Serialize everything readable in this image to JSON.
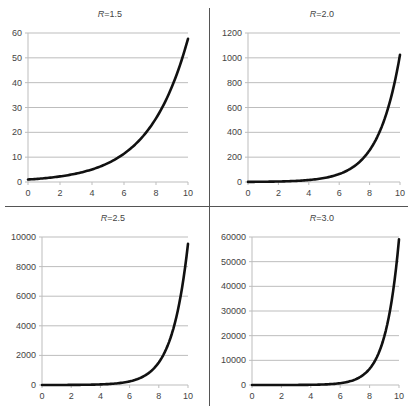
{
  "chart_data": [
    {
      "type": "line",
      "title": "R=1.5",
      "title_var": "R",
      "title_value": "=1.5",
      "R": 1.5,
      "xlabel": "",
      "ylabel": "",
      "xlim": [
        0,
        10
      ],
      "ylim": [
        0,
        60
      ],
      "xticks": [
        0,
        2,
        4,
        6,
        8,
        10
      ],
      "yticks": [
        0,
        10,
        20,
        30,
        40,
        50,
        60
      ],
      "grid": "horizontal",
      "function": "y = 1.5^x",
      "x": [
        0,
        1,
        2,
        3,
        4,
        5,
        6,
        7,
        8,
        9,
        10
      ],
      "values": [
        1,
        1.5,
        2.25,
        3.38,
        5.06,
        7.59,
        11.39,
        17.09,
        25.63,
        38.44,
        57.67
      ],
      "box": {
        "left": 28,
        "right": 188,
        "top": 33,
        "bottom": 182
      }
    },
    {
      "type": "line",
      "title": "R=2.0",
      "title_var": "R",
      "title_value": "=2.0",
      "R": 2.0,
      "xlabel": "",
      "ylabel": "",
      "xlim": [
        0,
        10
      ],
      "ylim": [
        0,
        1200
      ],
      "xticks": [
        0,
        2,
        4,
        6,
        8,
        10
      ],
      "yticks": [
        0,
        200,
        400,
        600,
        800,
        1000,
        1200
      ],
      "grid": "horizontal",
      "function": "y = 2^x",
      "x": [
        0,
        1,
        2,
        3,
        4,
        5,
        6,
        7,
        8,
        9,
        10
      ],
      "values": [
        1,
        2,
        4,
        8,
        16,
        32,
        64,
        128,
        256,
        512,
        1024
      ],
      "box": {
        "left": 248,
        "right": 400,
        "top": 33,
        "bottom": 182
      }
    },
    {
      "type": "line",
      "title": "R=2.5",
      "title_var": "R",
      "title_value": "=2.5",
      "R": 2.5,
      "xlabel": "",
      "ylabel": "",
      "xlim": [
        0,
        10
      ],
      "ylim": [
        0,
        10000
      ],
      "xticks": [
        0,
        2,
        4,
        6,
        8,
        10
      ],
      "yticks": [
        0,
        2000,
        4000,
        6000,
        8000,
        10000
      ],
      "grid": "horizontal",
      "function": "y = 2.5^x",
      "x": [
        0,
        1,
        2,
        3,
        4,
        5,
        6,
        7,
        8,
        9,
        10
      ],
      "values": [
        1,
        2.5,
        6.25,
        15.63,
        39.06,
        97.66,
        244.14,
        610.35,
        1525.88,
        3814.7,
        9536.74
      ],
      "box": {
        "left": 42,
        "right": 188,
        "top": 237,
        "bottom": 385
      }
    },
    {
      "type": "line",
      "title": "R=3.0",
      "title_var": "R",
      "title_value": "=3.0",
      "R": 3.0,
      "xlabel": "",
      "ylabel": "",
      "xlim": [
        0,
        10
      ],
      "ylim": [
        0,
        60000
      ],
      "xticks": [
        0,
        2,
        4,
        6,
        8,
        10
      ],
      "yticks": [
        0,
        10000,
        20000,
        30000,
        40000,
        50000,
        60000
      ],
      "grid": "horizontal",
      "function": "y = 3^x",
      "x": [
        0,
        1,
        2,
        3,
        4,
        5,
        6,
        7,
        8,
        9,
        10
      ],
      "values": [
        1,
        3,
        9,
        27,
        81,
        243,
        729,
        2187,
        6561,
        19683,
        59049
      ],
      "box": {
        "left": 252,
        "right": 399,
        "top": 237,
        "bottom": 385
      }
    }
  ],
  "colors": {
    "line": "#111111",
    "grid": "#bdbdbd",
    "axis": "#bdbdbd",
    "divider": "#555555",
    "text": "#444444"
  },
  "title_positions": [
    {
      "x": 110,
      "y": 17
    },
    {
      "x": 322,
      "y": 17
    },
    {
      "x": 113,
      "y": 221
    },
    {
      "x": 322,
      "y": 221
    }
  ]
}
